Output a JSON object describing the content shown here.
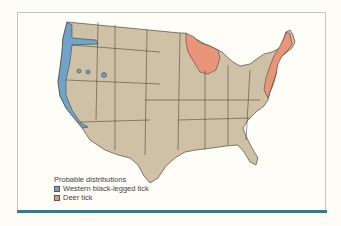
{
  "legend": {
    "title": "Probable distributions",
    "items": [
      {
        "label": "Western black-legged tick",
        "color": "#6fa3c8"
      },
      {
        "label": "Deer tick",
        "color": "#e8957a"
      }
    ]
  },
  "map": {
    "land_color": "#cfc1a6",
    "border_color": "#3a3128",
    "frame_bar_color": "#2e7f95"
  }
}
